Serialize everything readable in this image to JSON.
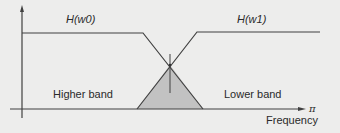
{
  "diagram": {
    "type": "filter-bank-frequency-response",
    "curves": [
      {
        "id": "w0",
        "label": "H(w0)",
        "shape": "lowpass",
        "passband_region": "Higher band"
      },
      {
        "id": "w1",
        "label": "H(w1)",
        "shape": "highpass",
        "passband_region": "Lower band"
      }
    ],
    "regions": {
      "left_label": "Higher band",
      "right_label": "Lower band",
      "overlap": "shaded transition triangle"
    },
    "axes": {
      "x_label": "Frequency",
      "x_end_tick": "π"
    },
    "colors": {
      "background": "#ededec",
      "line": "#404040",
      "overlap_fill": "#c2c2c2"
    }
  }
}
